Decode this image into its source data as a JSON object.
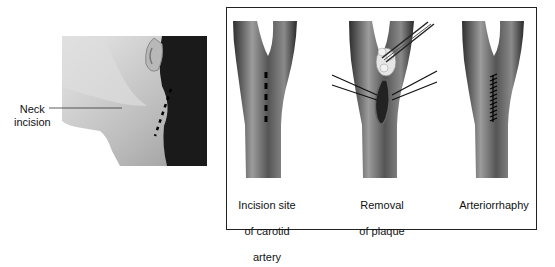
{
  "left_panel": {
    "label": "Neck\nincision",
    "label_line1": "Neck",
    "label_line2": "incision"
  },
  "right_panel": {
    "steps": [
      {
        "line1": "Incision site",
        "line2": "of carotid",
        "line3": "artery"
      },
      {
        "line1": "Removal",
        "line2": "of plaque"
      },
      {
        "line1": "Arteriorrhaphy"
      }
    ]
  },
  "colors": {
    "frame": "#222222",
    "artery_dark": "#3a3a3a",
    "artery_light": "#9a9a9a",
    "hair": "#1a1a1a",
    "skin": "#cfcfcf"
  }
}
